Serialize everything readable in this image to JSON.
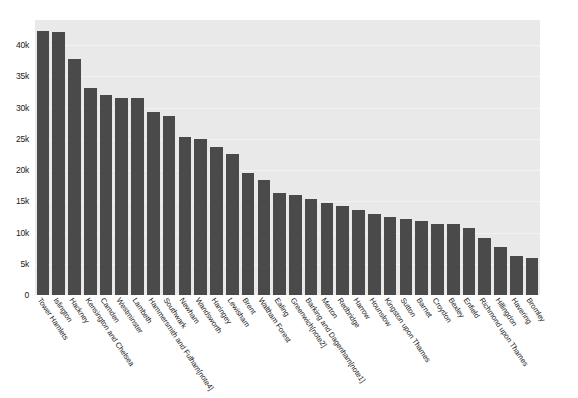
{
  "chart_data": {
    "type": "bar",
    "title": "",
    "subtitle": "",
    "xlabel": "",
    "ylabel": "",
    "ylim": [
      0,
      44000
    ],
    "grid": true,
    "legend": "none",
    "orientation": "vertical",
    "bar_color": "#4a4a4a",
    "plot_background": "#e9e9e9",
    "y_ticks": [
      0,
      5000,
      10000,
      15000,
      20000,
      25000,
      30000,
      35000,
      40000
    ],
    "y_tick_labels": [
      "0",
      "5k",
      "10k",
      "15k",
      "20k",
      "25k",
      "30k",
      "35k",
      "40k"
    ],
    "categories": [
      "Tower Hamlets",
      "Islington",
      "Hackney",
      "Kensington and Chelsea",
      "Camden",
      "Westminster",
      "Lambeth",
      "Hammersmith and Fulham[note4]",
      "Southwark",
      "Newham",
      "Wandsworth",
      "Haringey",
      "Lewisham",
      "Brent",
      "Waltham Forest",
      "Ealing",
      "Greenwich[note2]",
      "Barking and Dagenham[note1]",
      "Merton",
      "Redbridge",
      "Harrow",
      "Hounslow",
      "Kingston upon Thames",
      "Sutton",
      "Barnet",
      "Croydon",
      "Bexley",
      "Enfield",
      "Richmond upon Thames",
      "Hillingdon",
      "Havering",
      "Bromley"
    ],
    "values": [
      42300,
      42100,
      37800,
      33100,
      32000,
      31500,
      31500,
      29300,
      28700,
      25300,
      24900,
      23700,
      22600,
      19600,
      18400,
      16300,
      16000,
      15400,
      14700,
      14200,
      13600,
      13000,
      12500,
      12100,
      11900,
      11400,
      11300,
      10700,
      9200,
      7700,
      6200,
      6000
    ]
  }
}
